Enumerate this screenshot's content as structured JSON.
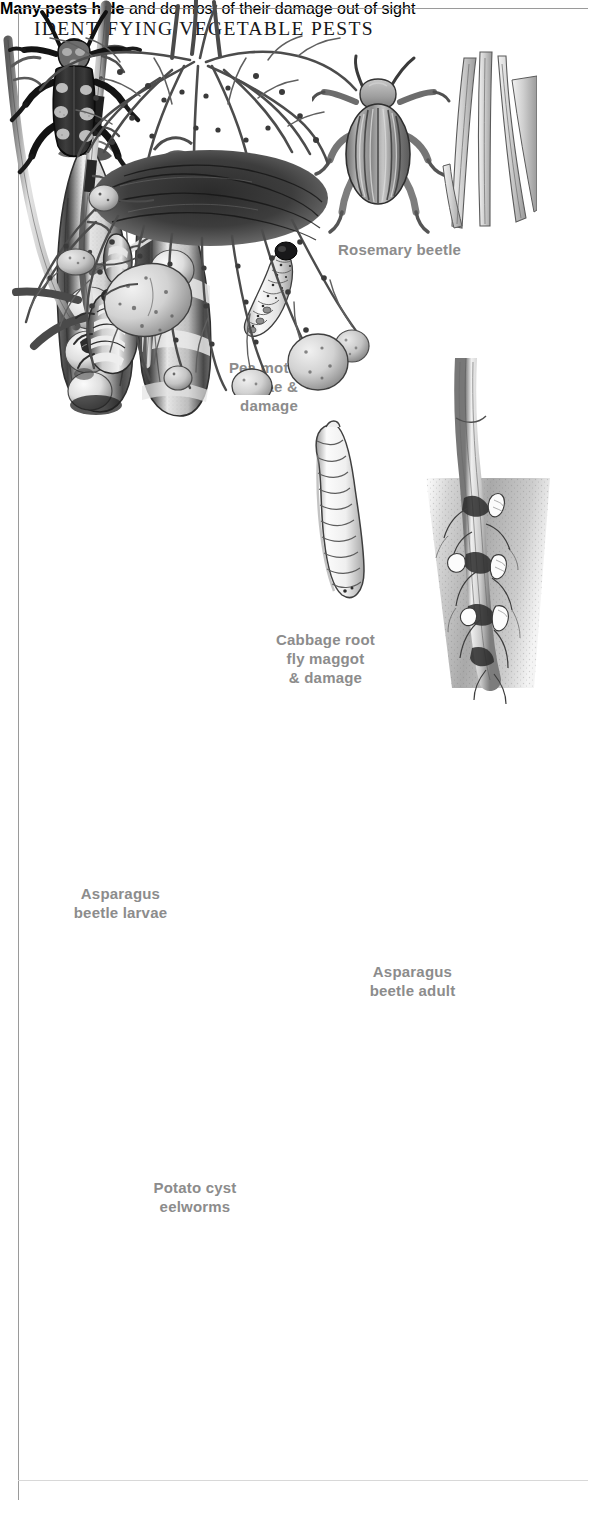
{
  "plate": {
    "title": "IDENTIFYING VEGETABLE PESTS",
    "caption_lead": "Many pests hide",
    "caption_rest": " and do most of their damage out of sight"
  },
  "labels": {
    "rosemary_beetle": "Rosemary beetle",
    "pea_moth": "Pea moth\nlarvae &\ndamage",
    "pea_moth_line1": "Pea moth",
    "pea_moth_line2": "larvae &",
    "pea_moth_line3": "damage",
    "cabbage_line1": "Cabbage root",
    "cabbage_line2": "fly maggot",
    "cabbage_line3": "& damage",
    "asparagus_larvae_line1": "Asparagus",
    "asparagus_larvae_line2": "beetle larvae",
    "asparagus_adult_line1": "Asparagus",
    "asparagus_adult_line2": "beetle adult",
    "potato_line1": "Potato cyst",
    "potato_line2": "eelworms"
  },
  "figures": [
    {
      "name": "pea-pod-damage",
      "alt": "Two split pea pods showing peas and pea moth larval damage"
    },
    {
      "name": "pea-moth-larva",
      "alt": "Pale segmented caterpillar with dark head"
    },
    {
      "name": "rosemary-beetle",
      "alt": "Striped metallic beetle beside rosemary foliage"
    },
    {
      "name": "cabbage-root-fly-maggot",
      "alt": "White legless maggot, ringed body"
    },
    {
      "name": "cabbage-root-damage",
      "alt": "Brassica root in soil with maggots feeding"
    },
    {
      "name": "asparagus-beetle-larvae",
      "alt": "Grey grub larvae on asparagus fern stems"
    },
    {
      "name": "asparagus-beetle-adult",
      "alt": "Dark beetle with pale cream blotches on elytra"
    },
    {
      "name": "potato-cyst-eelworms",
      "alt": "Potato root ball with tubers and cysts on roots"
    }
  ],
  "colors": {
    "label_grey": "#8c8c8c",
    "title_black": "#17171a",
    "rule_grey": "#9a9a9a",
    "caption_grey": "#39393b"
  }
}
